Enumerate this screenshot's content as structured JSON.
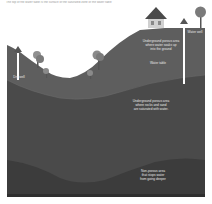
{
  "caption": "The top of the water table is the surface of the saturated zone of the water table",
  "labels": {
    "water_well": "Water well",
    "dry_well": "Dry well",
    "unsaturated_zone": [
      "Underground porous area",
      "where water soaks up",
      "into the ground"
    ],
    "water_table": "Water table",
    "saturated_zone": [
      "Underground porous area",
      "where rocks and sand",
      "are saturated with water."
    ],
    "non_porous_zone": [
      "Non-porous area",
      "that stops water",
      "from going deeper"
    ]
  },
  "colors": {
    "background": "#ffffff",
    "unsaturated": "#5e5e5e",
    "saturated": "#484848",
    "non_porous": "#3a3a3a",
    "well_shaft": "#ffffff",
    "tree_foliage": "#8a8a8a",
    "house_roof": "#4a4a4a",
    "house_wall": "#cfcfcf"
  }
}
